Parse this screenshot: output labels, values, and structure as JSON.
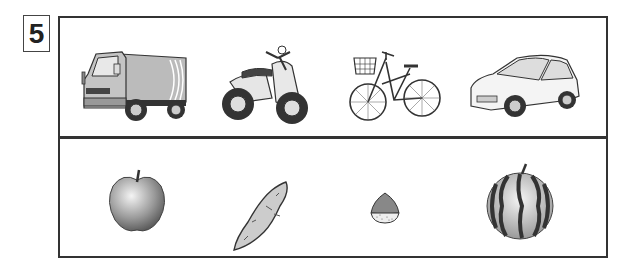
{
  "question": {
    "number": "5"
  },
  "rows": [
    {
      "name": "vehicles",
      "items": [
        {
          "id": "truck",
          "label": "truck"
        },
        {
          "id": "scooter",
          "label": "scooter"
        },
        {
          "id": "bicycle",
          "label": "bicycle"
        },
        {
          "id": "car",
          "label": "car"
        }
      ]
    },
    {
      "name": "foods",
      "items": [
        {
          "id": "apple",
          "label": "apple"
        },
        {
          "id": "sweet-potato",
          "label": "sweet potato"
        },
        {
          "id": "chestnut",
          "label": "chestnut"
        },
        {
          "id": "watermelon",
          "label": "watermelon"
        }
      ]
    }
  ]
}
